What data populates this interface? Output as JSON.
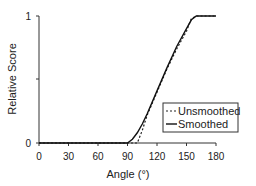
{
  "chart_data": {
    "type": "line",
    "title": "",
    "xlabel": "Angle (°)",
    "ylabel": "Relative Score",
    "xlim": [
      0,
      180
    ],
    "ylim": [
      0,
      1
    ],
    "x_ticks": [
      "0",
      "30",
      "60",
      "90",
      "120",
      "150",
      "180"
    ],
    "y_ticks": [
      "0",
      "",
      "1"
    ],
    "grid": false,
    "legend_position": "lower right",
    "series": [
      {
        "name": "Unsmoothed",
        "style": "dashed",
        "x": [
          0,
          90,
          100,
          105,
          110,
          120,
          130,
          140,
          150,
          155,
          160,
          170,
          180
        ],
        "y": [
          0,
          0,
          0.0,
          0.1,
          0.22,
          0.4,
          0.58,
          0.74,
          0.88,
          0.98,
          1.0,
          1.0,
          1.0
        ]
      },
      {
        "name": "Smoothed",
        "style": "solid",
        "x": [
          0,
          90,
          95,
          100,
          105,
          110,
          120,
          130,
          140,
          150,
          155,
          160,
          170,
          180
        ],
        "y": [
          0,
          0,
          0.03,
          0.08,
          0.15,
          0.23,
          0.41,
          0.59,
          0.76,
          0.9,
          0.97,
          1.0,
          1.0,
          1.0
        ]
      }
    ]
  },
  "legend": {
    "unsmoothed": "Unsmoothed",
    "smoothed": "Smoothed"
  },
  "axes": {
    "xlabel": "Angle (°)",
    "ylabel": "Relative Score",
    "x_tick_labels": [
      "0",
      "30",
      "60",
      "90",
      "120",
      "150",
      "180"
    ],
    "y_tick_top": "1",
    "y_tick_bottom": "0"
  }
}
